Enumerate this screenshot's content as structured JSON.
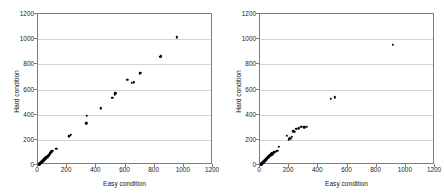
{
  "figure": {
    "background": "#ffffff",
    "axis_color": "#7d7d7d",
    "grid_color": "#d4d4d4",
    "marker_color": "#000000"
  },
  "chart_data": [
    {
      "type": "scatter",
      "title": "(a) Sptatial words",
      "xlabel": "Easy condition",
      "ylabel": "Hard condition",
      "xlim": [
        0,
        1200
      ],
      "ylim": [
        0,
        1200
      ],
      "xticks": [
        0,
        200,
        400,
        600,
        800,
        1000,
        1200
      ],
      "yticks": [
        0,
        200,
        400,
        600,
        800,
        1000,
        1200
      ],
      "grid": "horizontal",
      "legend": "none",
      "points": [
        [
          5,
          4
        ],
        [
          8,
          6
        ],
        [
          10,
          9
        ],
        [
          12,
          8
        ],
        [
          14,
          14
        ],
        [
          16,
          12
        ],
        [
          18,
          18
        ],
        [
          20,
          16
        ],
        [
          22,
          22
        ],
        [
          24,
          20
        ],
        [
          26,
          26
        ],
        [
          28,
          24
        ],
        [
          30,
          30
        ],
        [
          32,
          28
        ],
        [
          34,
          36
        ],
        [
          36,
          33
        ],
        [
          38,
          40
        ],
        [
          40,
          38
        ],
        [
          42,
          45
        ],
        [
          45,
          44
        ],
        [
          47,
          50
        ],
        [
          50,
          52
        ],
        [
          52,
          48
        ],
        [
          55,
          58
        ],
        [
          58,
          60
        ],
        [
          60,
          56
        ],
        [
          63,
          66
        ],
        [
          66,
          70
        ],
        [
          68,
          64
        ],
        [
          70,
          74
        ],
        [
          73,
          78
        ],
        [
          76,
          82
        ],
        [
          79,
          86
        ],
        [
          82,
          90
        ],
        [
          85,
          95
        ],
        [
          88,
          100
        ],
        [
          92,
          104
        ],
        [
          96,
          110
        ],
        [
          100,
          112
        ],
        [
          125,
          130
        ],
        [
          210,
          228
        ],
        [
          218,
          232
        ],
        [
          226,
          240
        ],
        [
          330,
          332
        ],
        [
          334,
          392
        ],
        [
          430,
          452
        ],
        [
          510,
          535
        ],
        [
          525,
          562
        ],
        [
          530,
          570
        ],
        [
          612,
          678
        ],
        [
          645,
          655
        ],
        [
          658,
          657
        ],
        [
          700,
          728
        ],
        [
          706,
          735
        ],
        [
          838,
          858
        ],
        [
          842,
          865
        ],
        [
          950,
          1015
        ]
      ]
    },
    {
      "type": "scatter",
      "title": "(b) Non-sptatial words",
      "xlabel": "Easy condition",
      "ylabel": "Hard condition",
      "xlim": [
        0,
        1200
      ],
      "ylim": [
        0,
        1200
      ],
      "xticks": [
        0,
        200,
        400,
        600,
        800,
        1000,
        1200
      ],
      "yticks": [
        0,
        200,
        400,
        600,
        800,
        1000,
        1200
      ],
      "grid": "horizontal",
      "legend": "none",
      "points": [
        [
          4,
          3
        ],
        [
          6,
          7
        ],
        [
          8,
          5
        ],
        [
          10,
          11
        ],
        [
          12,
          9
        ],
        [
          14,
          15
        ],
        [
          16,
          13
        ],
        [
          18,
          20
        ],
        [
          20,
          17
        ],
        [
          22,
          24
        ],
        [
          24,
          21
        ],
        [
          26,
          28
        ],
        [
          28,
          26
        ],
        [
          30,
          33
        ],
        [
          32,
          30
        ],
        [
          34,
          38
        ],
        [
          36,
          35
        ],
        [
          38,
          42
        ],
        [
          40,
          40
        ],
        [
          42,
          47
        ],
        [
          44,
          45
        ],
        [
          46,
          52
        ],
        [
          48,
          50
        ],
        [
          50,
          57
        ],
        [
          52,
          55
        ],
        [
          55,
          62
        ],
        [
          57,
          60
        ],
        [
          60,
          68
        ],
        [
          62,
          65
        ],
        [
          65,
          73
        ],
        [
          68,
          78
        ],
        [
          70,
          72
        ],
        [
          72,
          82
        ],
        [
          75,
          80
        ],
        [
          78,
          88
        ],
        [
          82,
          92
        ],
        [
          85,
          86
        ],
        [
          90,
          96
        ],
        [
          95,
          100
        ],
        [
          105,
          106
        ],
        [
          118,
          112
        ],
        [
          128,
          146
        ],
        [
          182,
          234
        ],
        [
          196,
          204
        ],
        [
          205,
          215
        ],
        [
          212,
          208
        ],
        [
          218,
          222
        ],
        [
          228,
          268
        ],
        [
          238,
          262
        ],
        [
          248,
          288
        ],
        [
          265,
          292
        ],
        [
          282,
          303
        ],
        [
          305,
          300
        ],
        [
          322,
          305
        ],
        [
          484,
          527
        ],
        [
          512,
          538
        ],
        [
          910,
          955
        ]
      ]
    }
  ]
}
